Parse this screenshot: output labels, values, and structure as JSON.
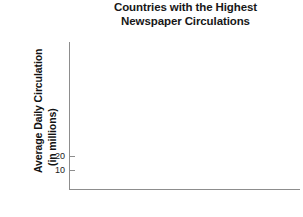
{
  "chart_data": {
    "type": "bar",
    "title": "Countries with the Highest Newspaper Circulations",
    "title_lines": [
      "Countries with the Highest",
      "Newspaper Circulations"
    ],
    "xlabel": "",
    "ylabel": "Average Daily Circulation (in millions)",
    "ylabel_lines": [
      "Average Daily Circulation",
      "(in millions)"
    ],
    "categories": [],
    "values": [],
    "series": [],
    "y_ticks": [
      {
        "label": "20",
        "value": 20
      },
      {
        "label": "10",
        "value": 10
      }
    ],
    "x_ticks": [],
    "ylim": [
      0,
      115
    ],
    "grid": false,
    "legend": false,
    "legend_position": "none",
    "annotations": [],
    "note": "Empty plot area — no bars or data marks are drawn",
    "colors": {
      "background": "#ffffff",
      "axis": "#8d8d8d",
      "title_text": "#181818",
      "label_text": "#121212",
      "tick_text": "#1b1b1b"
    }
  }
}
